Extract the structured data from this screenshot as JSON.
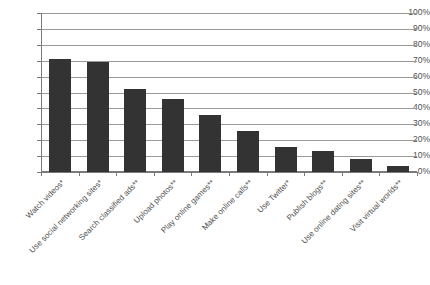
{
  "chart_data": {
    "type": "bar",
    "title": "",
    "xlabel": "",
    "ylabel": "",
    "ylim": [
      0,
      100
    ],
    "grid": true,
    "legend": "none",
    "categories": [
      "Watch videos*",
      "Use social networking sites*",
      "Search classified ads**",
      "Upload photos**",
      "Play online games**",
      "Make online calls**",
      "Use Twitter*",
      "Publish blogs**",
      "Use online dating sites**",
      "Visit virtual worlds**"
    ],
    "values": [
      71,
      69,
      52,
      46,
      36,
      26,
      16,
      13,
      8,
      4
    ],
    "ytick_labels": [
      "100%",
      "90%",
      "80%",
      "70%",
      "60%",
      "50%",
      "40%",
      "30%",
      "20%",
      "10%",
      "0%"
    ],
    "ytick_values": [
      100,
      90,
      80,
      70,
      60,
      50,
      40,
      30,
      20,
      10,
      0
    ],
    "bar_color": "#333333",
    "gridline_color": "#9a9a9a",
    "axis_color": "#7a7a7a",
    "background_color": "#ffffff"
  }
}
